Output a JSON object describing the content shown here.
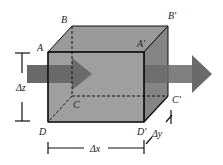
{
  "diagram": {
    "type": "control-volume-flux",
    "colors": {
      "box_fill": "#8a8a8a",
      "box_top": "#9a9a9a",
      "box_side": "#7e7e7e",
      "arrow": "#5f5f5f",
      "line": "#111111"
    },
    "vertices": {
      "A": "A",
      "B": "B",
      "C": "C",
      "D": "D",
      "A_prime": "A'",
      "B_prime": "B'",
      "C_prime": "C'",
      "D_prime": "D'"
    },
    "dimensions": {
      "dz": "Δz",
      "dx": "Δx",
      "dy": "Δy"
    },
    "arrows": [
      {
        "name": "inflow-arrow",
        "direction": "right",
        "position": "left face"
      },
      {
        "name": "outflow-arrow",
        "direction": "right",
        "position": "right face"
      }
    ]
  }
}
